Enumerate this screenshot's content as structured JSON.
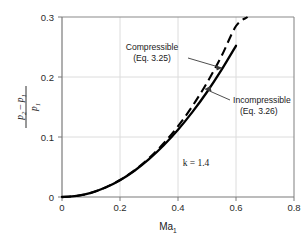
{
  "chart_data": {
    "type": "line",
    "title": "",
    "subtitle": "",
    "xlabel": "Ma₁",
    "ylabel": "(p₂ − p₁)/p₁",
    "xlim": [
      0,
      0.8
    ],
    "ylim": [
      0,
      0.3
    ],
    "grid": true,
    "legend_position": "inline-annotations",
    "xticks": [
      "0",
      "0.2",
      "0.4",
      "0.6",
      "0.8"
    ],
    "xtick_values": [
      0,
      0.2,
      0.4,
      0.6,
      0.8
    ],
    "yticks": [
      "0",
      "0.1",
      "0.2",
      "0.3"
    ],
    "ytick_values": [
      0,
      0.1,
      0.2,
      0.3
    ],
    "series": [
      {
        "name": "Incompressible (Eq. 3.26)",
        "style": "solid",
        "color": "#000000",
        "x": [
          0.0,
          0.05,
          0.1,
          0.15,
          0.2,
          0.25,
          0.3,
          0.35,
          0.4,
          0.45,
          0.5,
          0.55,
          0.6
        ],
        "values": [
          0.0,
          0.0018,
          0.007,
          0.0158,
          0.028,
          0.0438,
          0.063,
          0.0858,
          0.112,
          0.1418,
          0.175,
          0.2118,
          0.252
        ]
      },
      {
        "name": "Compressible (Eq. 3.25)",
        "style": "dashed",
        "color": "#000000",
        "x": [
          0.0,
          0.05,
          0.1,
          0.15,
          0.2,
          0.25,
          0.3,
          0.35,
          0.4,
          0.45,
          0.5,
          0.55,
          0.6,
          0.64
        ],
        "values": [
          0.0,
          0.0018,
          0.007,
          0.0159,
          0.0283,
          0.0445,
          0.0647,
          0.0891,
          0.118,
          0.1517,
          0.1905,
          0.2348,
          0.285,
          0.3
        ]
      }
    ],
    "annotations": [
      {
        "id": "compressible",
        "label_line1": "Compressible",
        "label_line2": "(Eq. 3.25)",
        "points_to_x": 0.55,
        "points_to_y": 0.225
      },
      {
        "id": "incompressible",
        "label_line1": "Incompressible",
        "label_line2": "(Eq. 3.26)",
        "points_to_x": 0.49,
        "points_to_y": 0.172
      },
      {
        "id": "k-value",
        "label_line1": "k = 1.4",
        "label_line2": "",
        "points_to_x": null,
        "points_to_y": null
      }
    ],
    "ylabel_parts": {
      "numerator_p": "p",
      "numerator_sub2": "2",
      "numerator_minus": "–",
      "numerator_p2": "p",
      "numerator_sub1": "1",
      "denominator_p": "p",
      "denominator_sub": "1"
    },
    "xlabel_parts": {
      "base": "Ma",
      "sub": "1"
    },
    "colors": {
      "axis": "#6e6e6e",
      "grid": "#d9d9d9",
      "curve": "#000000",
      "text": "#1a1a1a",
      "background": "#ffffff"
    }
  }
}
